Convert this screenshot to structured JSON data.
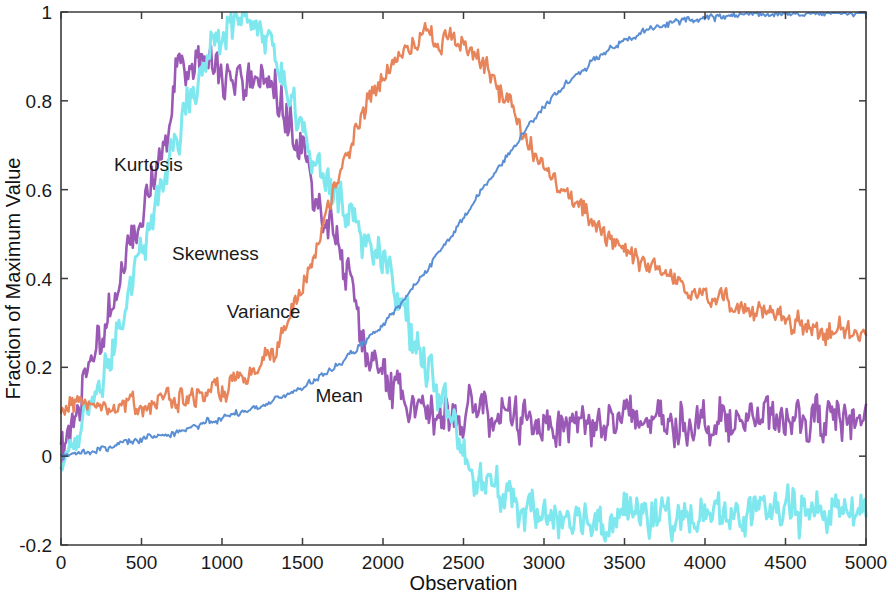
{
  "chart_data": {
    "type": "line",
    "title": "",
    "xlabel": "Observation",
    "ylabel": "Fraction of Maximum Value",
    "xlim": [
      0,
      5000
    ],
    "ylim": [
      -0.2,
      1.0
    ],
    "xticks": [
      0,
      500,
      1000,
      1500,
      2000,
      2500,
      3000,
      3500,
      4000,
      4500,
      5000
    ],
    "xticklabels": [
      "0",
      "500",
      "1000",
      "1500",
      "2000",
      "2500",
      "3000",
      "3500",
      "4000",
      "4500",
      "5000"
    ],
    "yticks": [
      -0.2,
      0,
      0.2,
      0.4,
      0.6,
      0.8,
      1
    ],
    "yticklabels": [
      "-0.2",
      "0",
      "0.2",
      "0.4",
      "0.6",
      "0.8",
      "1"
    ],
    "grid": false,
    "legend": "inline-labels",
    "frame": "box",
    "tick_direction": "in",
    "background": "#ffffff",
    "noise": {
      "Kurtosis": 0.03,
      "Skewness": 0.028,
      "Variance": 0.016,
      "Mean": 0.005
    },
    "series": [
      {
        "name": "Kurtosis",
        "color": "#9B59B6",
        "linewidth": 2.6,
        "label_x": 330,
        "label_y": 0.655,
        "x": [
          0,
          60,
          120,
          200,
          280,
          360,
          440,
          520,
          600,
          660,
          720,
          780,
          840,
          900,
          960,
          1020,
          1080,
          1140,
          1200,
          1260,
          1320,
          1400,
          1480,
          1560,
          1640,
          1720,
          1800,
          1860,
          1920,
          2000,
          2100,
          2200,
          2350,
          2500,
          2700,
          2900,
          3100,
          3300,
          3500,
          3700,
          3900,
          4100,
          4300,
          4500,
          4700,
          4850,
          5000
        ],
        "y": [
          0.0,
          0.07,
          0.145,
          0.225,
          0.305,
          0.395,
          0.48,
          0.575,
          0.665,
          0.74,
          0.905,
          0.87,
          0.885,
          0.87,
          0.875,
          0.855,
          0.845,
          0.83,
          0.845,
          0.85,
          0.815,
          0.775,
          0.705,
          0.625,
          0.545,
          0.47,
          0.395,
          0.285,
          0.205,
          0.165,
          0.135,
          0.12,
          0.108,
          0.1,
          0.092,
          0.083,
          0.078,
          0.08,
          0.079,
          0.082,
          0.08,
          0.081,
          0.082,
          0.083,
          0.082,
          0.083,
          0.084
        ]
      },
      {
        "name": "Skewness",
        "color": "#7FE8EF",
        "linewidth": 3.0,
        "label_x": 690,
        "label_y": 0.455,
        "x": [
          0,
          80,
          160,
          240,
          320,
          400,
          480,
          560,
          640,
          720,
          800,
          880,
          960,
          1040,
          1100,
          1160,
          1220,
          1280,
          1340,
          1400,
          1480,
          1560,
          1640,
          1720,
          1800,
          1880,
          1960,
          2060,
          2160,
          2260,
          2360,
          2460,
          2560,
          2680,
          2800,
          2950,
          3100,
          3250,
          3400,
          3600,
          3800,
          4000,
          4200,
          4400,
          4600,
          4800,
          5000
        ],
        "y": [
          0.0,
          0.035,
          0.09,
          0.165,
          0.245,
          0.335,
          0.43,
          0.525,
          0.62,
          0.71,
          0.805,
          0.88,
          0.935,
          0.985,
          0.97,
          0.99,
          0.965,
          0.935,
          0.885,
          0.82,
          0.74,
          0.675,
          0.63,
          0.59,
          0.545,
          0.5,
          0.455,
          0.385,
          0.3,
          0.215,
          0.125,
          0.045,
          -0.02,
          -0.075,
          -0.105,
          -0.125,
          -0.135,
          -0.14,
          -0.135,
          -0.132,
          -0.138,
          -0.133,
          -0.13,
          -0.128,
          -0.125,
          -0.12,
          -0.118
        ]
      },
      {
        "name": "Variance",
        "color": "#E8845A",
        "linewidth": 2.4,
        "label_x": 1030,
        "label_y": 0.325,
        "x": [
          0,
          150,
          300,
          450,
          600,
          750,
          900,
          1050,
          1150,
          1250,
          1350,
          1450,
          1550,
          1650,
          1750,
          1850,
          1950,
          2050,
          2150,
          2250,
          2350,
          2450,
          2550,
          2650,
          2750,
          2850,
          2950,
          3050,
          3150,
          3300,
          3450,
          3600,
          3750,
          3900,
          4050,
          4200,
          4350,
          4500,
          4650,
          4800,
          5000
        ],
        "y": [
          0.115,
          0.116,
          0.118,
          0.12,
          0.124,
          0.13,
          0.14,
          0.155,
          0.172,
          0.2,
          0.25,
          0.33,
          0.43,
          0.545,
          0.665,
          0.755,
          0.825,
          0.875,
          0.915,
          0.955,
          0.93,
          0.945,
          0.92,
          0.875,
          0.81,
          0.735,
          0.675,
          0.625,
          0.585,
          0.53,
          0.485,
          0.445,
          0.41,
          0.385,
          0.36,
          0.34,
          0.32,
          0.305,
          0.29,
          0.28,
          0.268
        ]
      },
      {
        "name": "Mean",
        "color": "#5B8FD4",
        "linewidth": 2.0,
        "label_x": 1580,
        "label_y": 0.135,
        "x": [
          0,
          250,
          500,
          750,
          1000,
          1250,
          1500,
          1750,
          1900,
          2050,
          2200,
          2350,
          2500,
          2650,
          2800,
          2950,
          3100,
          3250,
          3400,
          3550,
          3700,
          3850,
          4000,
          4150,
          4300,
          4500,
          4700,
          4850,
          5000
        ],
        "y": [
          0.0,
          0.018,
          0.038,
          0.06,
          0.085,
          0.115,
          0.155,
          0.215,
          0.26,
          0.315,
          0.385,
          0.46,
          0.535,
          0.615,
          0.695,
          0.765,
          0.825,
          0.875,
          0.915,
          0.945,
          0.965,
          0.98,
          0.988,
          0.993,
          0.997,
          0.998,
          0.998,
          0.999,
          0.999
        ]
      }
    ]
  }
}
